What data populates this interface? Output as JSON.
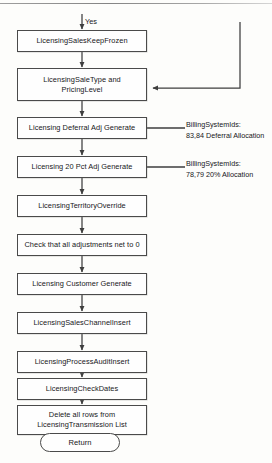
{
  "diagram": {
    "type": "flowchart",
    "entry_label": "Yes",
    "nodes": [
      {
        "id": "n1",
        "shape": "process",
        "text": "LicensingSalesKeepFrozen"
      },
      {
        "id": "n2",
        "shape": "process",
        "text": "LicensingSaleType and\nPricingLevel"
      },
      {
        "id": "n3",
        "shape": "process",
        "text": "Licensing Deferral Adj Generate"
      },
      {
        "id": "n4",
        "shape": "process",
        "text": "Licensing 20 Pct Adj Generate"
      },
      {
        "id": "n5",
        "shape": "process",
        "text": "LicensingTerritoryOverride"
      },
      {
        "id": "n6",
        "shape": "process",
        "text": "Check that all adjustments net to 0"
      },
      {
        "id": "n7",
        "shape": "process",
        "text": "Licensing Customer Generate"
      },
      {
        "id": "n8",
        "shape": "process",
        "text": "LicensingSalesChannelInsert"
      },
      {
        "id": "n9",
        "shape": "process",
        "text": "LicensingProcessAuditInsert"
      },
      {
        "id": "n10",
        "shape": "process",
        "text": "LicensingCheckDates"
      },
      {
        "id": "n11",
        "shape": "process",
        "text": "Delete all rows from\nLicensingTransmission List"
      },
      {
        "id": "n12",
        "shape": "terminator",
        "text": "Return"
      }
    ],
    "annotations": [
      {
        "id": "a1",
        "target": "n3",
        "text": "BillingSystemIds:\n83,84 Deferral Allocation"
      },
      {
        "id": "a2",
        "target": "n4",
        "text": "BillingSystemIds:\n78,79 20% Allocation"
      }
    ],
    "colors": {
      "stroke": "#4a4a4a",
      "text": "#17171a",
      "background": "#fdfdfb",
      "node_fill": "#fefefe"
    }
  }
}
